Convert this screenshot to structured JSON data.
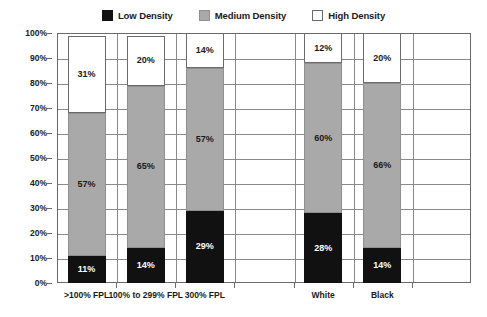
{
  "chart_data": {
    "type": "bar",
    "title": "",
    "subtitle": "",
    "xlabel": "",
    "ylabel": "",
    "ylim": [
      0,
      100
    ],
    "ytick_labels": [
      "100%",
      "90%",
      "80%",
      "70%",
      "60%",
      "50%",
      "40%",
      "30%",
      "20%",
      "10%",
      "0%"
    ],
    "ytick_values": [
      100,
      90,
      80,
      70,
      60,
      50,
      40,
      30,
      20,
      10,
      0
    ],
    "grid": true,
    "stacked": true,
    "stack_total": 100,
    "legend_position": "top-center",
    "categories": [
      ">100% FPL",
      "100% to 299% FPL",
      "300% FPL",
      "White",
      "Black"
    ],
    "series": [
      {
        "name": "Low Density",
        "color": "#111111",
        "values": [
          11,
          14,
          29,
          28,
          14
        ],
        "labels": [
          "11%",
          "14%",
          "29%",
          "28%",
          "14%"
        ]
      },
      {
        "name": "Medium Density",
        "color": "#a9a9a9",
        "values": [
          57,
          65,
          57,
          60,
          66
        ],
        "labels": [
          "57%",
          "65%",
          "57%",
          "60%",
          "66%"
        ]
      },
      {
        "name": "High Density",
        "color": "#ffffff",
        "values": [
          31,
          20,
          14,
          12,
          20
        ],
        "labels": [
          "31%",
          "20%",
          "14%",
          "12%",
          "20%"
        ]
      }
    ]
  },
  "legend": {
    "items": [
      {
        "label": "Low Density",
        "color": "#111111"
      },
      {
        "label": "Medium Density",
        "color": "#a9a9a9"
      },
      {
        "label": "High Density",
        "color": "#ffffff"
      }
    ]
  },
  "axes": {
    "y": {
      "ticks": [
        {
          "label": "100%",
          "value": 100
        },
        {
          "label": "90%",
          "value": 90
        },
        {
          "label": "80%",
          "value": 80
        },
        {
          "label": "70%",
          "value": 70
        },
        {
          "label": "60%",
          "value": 60
        },
        {
          "label": "50%",
          "value": 50
        },
        {
          "label": "40%",
          "value": 40
        },
        {
          "label": "30%",
          "value": 30
        },
        {
          "label": "20%",
          "value": 20
        },
        {
          "label": "10%",
          "value": 10
        },
        {
          "label": "0%",
          "value": 0
        }
      ]
    },
    "x": {
      "labels": [
        ">100% FPL",
        "100% to 299% FPL",
        "300% FPL",
        "White",
        "Black"
      ]
    }
  }
}
